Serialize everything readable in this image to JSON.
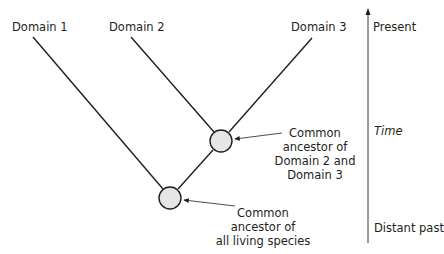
{
  "diagram": {
    "type": "phylogenetic-tree",
    "leaves": [
      {
        "label": "Domain 1"
      },
      {
        "label": "Domain 2"
      },
      {
        "label": "Domain 3"
      }
    ],
    "nodes": [
      {
        "label_lines": [
          "Common",
          "ancestor of",
          "Domain 2 and",
          "Domain 3"
        ]
      },
      {
        "label_lines": [
          "Common",
          "ancestor of",
          "all living species"
        ]
      }
    ],
    "time_axis": {
      "top_label": "Present",
      "middle_label": "Time",
      "bottom_label": "Distant past"
    },
    "colors": {
      "line": "#231f20",
      "node_fill": "#e6e6e6",
      "node_stroke": "#231f20",
      "text": "#231f20"
    }
  }
}
